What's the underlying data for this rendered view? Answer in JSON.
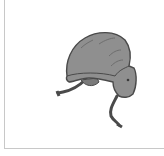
{
  "product_image": {
    "alt": "Gray flight helmet with chin straps",
    "icon": "helmet-icon",
    "colors": {
      "shell": "#8f8f8f",
      "outline": "#4a4a4a",
      "strap": "#5a5a5a",
      "border": "#c8c8c8"
    }
  }
}
